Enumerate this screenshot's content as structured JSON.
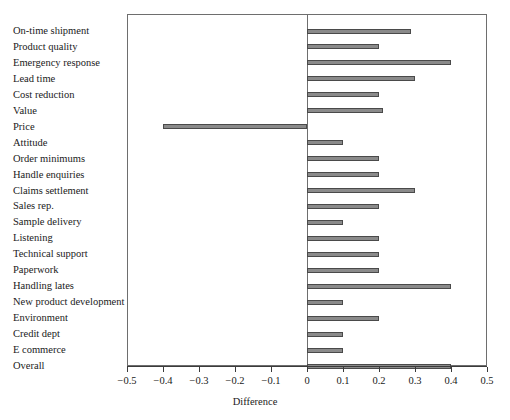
{
  "chart_data": {
    "type": "bar",
    "orientation": "horizontal",
    "title": "",
    "xlabel": "Difference",
    "ylabel": "",
    "xlim": [
      -0.5,
      0.5
    ],
    "xticks": [
      -0.5,
      -0.4,
      -0.3,
      -0.2,
      -0.1,
      0,
      0.1,
      0.2,
      0.3,
      0.4,
      0.5
    ],
    "xtick_labels": [
      "−0.5",
      "−0.4",
      "−0.3",
      "−0.2",
      "−0.1",
      "0",
      "0.1",
      "0.2",
      "0.3",
      "0.4",
      "0.5"
    ],
    "grid": false,
    "legend": null,
    "categories": [
      "On-time shipment",
      "Product quality",
      "Emergency response",
      "Lead time",
      "Cost reduction",
      "Value",
      "Price",
      "Attitude",
      "Order minimums",
      "Handle enquiries",
      "Claims settlement",
      "Sales rep.",
      "Sample delivery",
      "Listening",
      "Technical support",
      "Paperwork",
      "Handling lates",
      "New product development",
      "Environment",
      "Credit dept",
      "E commerce",
      "Overall"
    ],
    "values": [
      0.29,
      0.2,
      0.4,
      0.3,
      0.2,
      0.21,
      -0.4,
      0.1,
      0.2,
      0.2,
      0.3,
      0.2,
      0.1,
      0.2,
      0.2,
      0.2,
      0.4,
      0.1,
      0.2,
      0.1,
      0.1,
      0.4
    ],
    "bar_color": "#8a8a8a",
    "bar_edge_color": "#4a4a4a",
    "axis_color": "#6e6e6e"
  }
}
